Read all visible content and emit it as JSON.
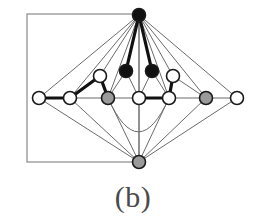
{
  "figure": {
    "caption": "(b)",
    "label": "b",
    "width": 266,
    "height": 222,
    "background": "#ffffff"
  },
  "style": {
    "node_stroke": "#1a1a1a",
    "node_fill_white": "#ffffff",
    "node_fill_gray": "#9a9a9a",
    "node_fill_black": "#111111",
    "node_radius": 6.5,
    "node_stroke_width": 1.6,
    "edge_thin_color": "#6b6b6b",
    "edge_thin_width": 1.0,
    "edge_bold_color": "#111111",
    "edge_bold_width": 3.2,
    "rect_color": "#8a8a8a",
    "rect_width": 1.2
  },
  "chart_data": {
    "type": "diagram",
    "title": "(b)",
    "nodes": [
      {
        "id": "t",
        "label": "top-apex",
        "x": 139,
        "y": 15,
        "fill": "black",
        "row": "top"
      },
      {
        "id": "u1",
        "label": "upper-left",
        "x": 100,
        "y": 76,
        "fill": "white",
        "row": "upper"
      },
      {
        "id": "u2",
        "label": "upper-mid-left",
        "x": 126,
        "y": 71,
        "fill": "black",
        "row": "upper"
      },
      {
        "id": "u3",
        "label": "upper-mid-right",
        "x": 152,
        "y": 71,
        "fill": "black",
        "row": "upper"
      },
      {
        "id": "u4",
        "label": "upper-right",
        "x": 173,
        "y": 76,
        "fill": "white",
        "row": "upper"
      },
      {
        "id": "s1",
        "label": "spine-1",
        "x": 39,
        "y": 98,
        "fill": "white",
        "row": "spine"
      },
      {
        "id": "s2",
        "label": "spine-2",
        "x": 70,
        "y": 98,
        "fill": "white",
        "row": "spine"
      },
      {
        "id": "s3",
        "label": "spine-3",
        "x": 108,
        "y": 98,
        "fill": "gray",
        "row": "spine"
      },
      {
        "id": "s4",
        "label": "spine-4",
        "x": 139,
        "y": 98,
        "fill": "white",
        "row": "spine"
      },
      {
        "id": "s5",
        "label": "spine-5",
        "x": 169,
        "y": 98,
        "fill": "white",
        "row": "spine"
      },
      {
        "id": "s6",
        "label": "spine-6",
        "x": 206,
        "y": 98,
        "fill": "gray",
        "row": "spine"
      },
      {
        "id": "s7",
        "label": "spine-7",
        "x": 237,
        "y": 98,
        "fill": "white",
        "row": "spine"
      },
      {
        "id": "b",
        "label": "bottom-apex",
        "x": 139,
        "y": 162,
        "fill": "gray",
        "row": "bottom"
      }
    ],
    "edges_thin": [
      [
        "t",
        "s1"
      ],
      [
        "t",
        "s2"
      ],
      [
        "t",
        "s3"
      ],
      [
        "t",
        "s4"
      ],
      [
        "t",
        "s5"
      ],
      [
        "t",
        "s6"
      ],
      [
        "t",
        "s7"
      ],
      [
        "t",
        "u1"
      ],
      [
        "t",
        "u4"
      ],
      [
        "u1",
        "s2"
      ],
      [
        "u1",
        "s3"
      ],
      [
        "u2",
        "s3"
      ],
      [
        "u2",
        "s4"
      ],
      [
        "u3",
        "s4"
      ],
      [
        "u3",
        "s5"
      ],
      [
        "u4",
        "s5"
      ],
      [
        "u4",
        "s6"
      ],
      [
        "s1",
        "s2"
      ],
      [
        "s2",
        "s3"
      ],
      [
        "s3",
        "s4"
      ],
      [
        "s4",
        "s5"
      ],
      [
        "s5",
        "s6"
      ],
      [
        "s6",
        "s7"
      ],
      [
        "b",
        "s1"
      ],
      [
        "b",
        "s2"
      ],
      [
        "b",
        "s3"
      ],
      [
        "b",
        "s4"
      ],
      [
        "b",
        "s5"
      ],
      [
        "b",
        "s6"
      ],
      [
        "b",
        "s7"
      ]
    ],
    "edges_bold": [
      [
        "s1",
        "s2"
      ],
      [
        "s2",
        "u1"
      ],
      [
        "u1",
        "s3"
      ],
      [
        "s4",
        "s5"
      ],
      [
        "s5",
        "u4"
      ],
      [
        "t",
        "u2"
      ],
      [
        "t",
        "u3"
      ]
    ],
    "arcs": [
      {
        "from": "s3",
        "to": "s5",
        "sag": 34,
        "style": "thin",
        "note": "curved edge bowing downward below the spine"
      }
    ],
    "rectangle": {
      "x": 27,
      "y": 14,
      "width": 112,
      "height": 148,
      "note": "outer frame, right edge passes through the top and bottom apex x-position"
    }
  }
}
